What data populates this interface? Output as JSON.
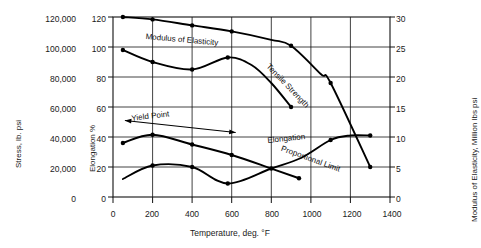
{
  "chart_data": {
    "type": "line",
    "title": "",
    "xlabel": "Temperature, deg. °F",
    "xlim": [
      0,
      1400
    ],
    "xticks": [
      0,
      200,
      400,
      600,
      800,
      1000,
      1200,
      1400
    ],
    "xticklabels": [
      "0",
      "200",
      "400",
      "600",
      "800",
      "1000",
      "1200",
      "1400"
    ],
    "grid": true,
    "legend_position": "inline-annotations",
    "axes": [
      {
        "id": "stress",
        "side": "left-outer",
        "label": "Stress, lb. psi",
        "lim": [
          0,
          120000
        ],
        "ticks": [
          0,
          20000,
          40000,
          60000,
          80000,
          100000,
          120000
        ],
        "ticklabels": [
          "0",
          "20,000",
          "40,000",
          "60,000",
          "80,000",
          "100,000",
          "120,000"
        ]
      },
      {
        "id": "elongation",
        "side": "left-inner",
        "label": "Elongation %",
        "lim": [
          0,
          120
        ],
        "ticks": [
          0,
          20,
          40,
          60,
          80,
          100,
          120
        ],
        "ticklabels": [
          "0",
          "20",
          "40",
          "60",
          "80",
          "100",
          "120"
        ]
      },
      {
        "id": "modulus",
        "side": "right",
        "label": "Modulus of Elasticity, Million lbs psi",
        "lim": [
          0,
          30
        ],
        "ticks": [
          0,
          5,
          10,
          15,
          20,
          25,
          30
        ],
        "ticklabels": [
          "0",
          "5",
          "10",
          "15",
          "20",
          "25",
          "30"
        ]
      }
    ],
    "series": [
      {
        "name": "Modulus of Elasticity",
        "axis": "modulus",
        "unit": "Million lbs psi",
        "label_text": "Modulus of Elasticity",
        "points": [
          {
            "x": 50,
            "y": 30.0
          },
          {
            "x": 200,
            "y": 29.6
          },
          {
            "x": 400,
            "y": 28.6
          },
          {
            "x": 600,
            "y": 27.6
          },
          {
            "x": 800,
            "y": 26.2
          },
          {
            "x": 900,
            "y": 25.2
          },
          {
            "x": 1050,
            "y": 20.5
          },
          {
            "x": 1100,
            "y": 19.0
          },
          {
            "x": 1300,
            "y": 5.0
          }
        ],
        "markers": [
          {
            "x": 50,
            "y": 30.0
          },
          {
            "x": 200,
            "y": 29.6
          },
          {
            "x": 400,
            "y": 28.6
          },
          {
            "x": 600,
            "y": 27.6
          },
          {
            "x": 900,
            "y": 25.2
          },
          {
            "x": 1100,
            "y": 19.0
          },
          {
            "x": 1300,
            "y": 5.0
          }
        ]
      },
      {
        "name": "Tensile Strength",
        "axis": "stress",
        "unit": "lb. psi",
        "label_text": "Tensile Strength",
        "points": [
          {
            "x": 50,
            "y": 98000
          },
          {
            "x": 200,
            "y": 90000
          },
          {
            "x": 400,
            "y": 85000
          },
          {
            "x": 580,
            "y": 93000
          },
          {
            "x": 700,
            "y": 88000
          },
          {
            "x": 800,
            "y": 76000
          },
          {
            "x": 900,
            "y": 60000
          }
        ],
        "markers": [
          {
            "x": 50,
            "y": 98000
          },
          {
            "x": 200,
            "y": 90000
          },
          {
            "x": 400,
            "y": 85000
          },
          {
            "x": 580,
            "y": 93000
          },
          {
            "x": 900,
            "y": 60000
          }
        ]
      },
      {
        "name": "Proportional Limit",
        "axis": "stress",
        "unit": "lb. psi",
        "label_text": "Proportional Limit",
        "points": [
          {
            "x": 50,
            "y": 36000
          },
          {
            "x": 200,
            "y": 41500
          },
          {
            "x": 400,
            "y": 35000
          },
          {
            "x": 600,
            "y": 28000
          },
          {
            "x": 800,
            "y": 19000
          },
          {
            "x": 940,
            "y": 12500
          }
        ],
        "markers": [
          {
            "x": 50,
            "y": 36000
          },
          {
            "x": 200,
            "y": 41500
          },
          {
            "x": 400,
            "y": 35000
          },
          {
            "x": 600,
            "y": 28000
          },
          {
            "x": 940,
            "y": 12500
          }
        ]
      },
      {
        "name": "Elongation",
        "axis": "elongation",
        "unit": "%",
        "label_text": "Elongation",
        "points": [
          {
            "x": 50,
            "y": 12
          },
          {
            "x": 200,
            "y": 21
          },
          {
            "x": 400,
            "y": 20
          },
          {
            "x": 580,
            "y": 9
          },
          {
            "x": 800,
            "y": 19
          },
          {
            "x": 950,
            "y": 26
          },
          {
            "x": 1100,
            "y": 38
          },
          {
            "x": 1200,
            "y": 41
          },
          {
            "x": 1300,
            "y": 41
          }
        ],
        "markers": [
          {
            "x": 200,
            "y": 21
          },
          {
            "x": 400,
            "y": 20
          },
          {
            "x": 580,
            "y": 9
          },
          {
            "x": 800,
            "y": 19
          },
          {
            "x": 1100,
            "y": 38
          },
          {
            "x": 1300,
            "y": 41
          }
        ]
      }
    ],
    "annotations": [
      {
        "name": "yield-point",
        "text": "Yield Point",
        "type": "double-arrow",
        "x_from": 60,
        "x_to": 620,
        "y_left": 51,
        "y_right": 43,
        "axis": "elongation"
      }
    ]
  }
}
